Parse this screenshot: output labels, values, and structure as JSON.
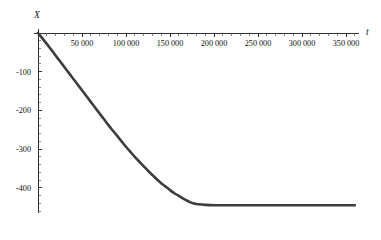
{
  "chart_data": {
    "type": "line",
    "title": "",
    "subtitle": "",
    "xlabel": "t",
    "ylabel": "X",
    "grid": false,
    "legend": null,
    "xlim": [
      0,
      365000
    ],
    "ylim": [
      -465,
      10
    ],
    "x_tick_labels": [
      "50 000",
      "100 000",
      "150 000",
      "200 000",
      "250 000",
      "300 000",
      "350 000"
    ],
    "x_tick_values": [
      50000,
      100000,
      150000,
      200000,
      250000,
      300000,
      350000
    ],
    "x_minor_tick_step": 10000,
    "y_tick_labels": [
      "-100",
      "-200",
      "-300",
      "-400"
    ],
    "y_tick_values": [
      -100,
      -200,
      -300,
      -400
    ],
    "y_minor_tick_step": 20,
    "series": [
      {
        "name": "X(t)",
        "color": "#3d3d3d",
        "line_width": 2.6,
        "x": [
          0,
          5000,
          10000,
          15000,
          20000,
          25000,
          30000,
          35000,
          40000,
          45000,
          50000,
          55000,
          60000,
          65000,
          70000,
          75000,
          80000,
          85000,
          90000,
          95000,
          100000,
          105000,
          110000,
          115000,
          120000,
          125000,
          130000,
          135000,
          140000,
          145000,
          150000,
          155000,
          160000,
          165000,
          170000,
          175000,
          180000,
          190000,
          200000,
          220000,
          240000,
          260000,
          280000,
          300000,
          320000,
          340000,
          360000
        ],
        "y": [
          0,
          -14,
          -28,
          -43,
          -58,
          -73,
          -88,
          -103,
          -118,
          -133,
          -148,
          -163,
          -178,
          -193,
          -208,
          -223,
          -238,
          -252,
          -266,
          -280,
          -294,
          -307,
          -320,
          -332,
          -344,
          -356,
          -367,
          -378,
          -388,
          -397,
          -406,
          -414,
          -421,
          -428,
          -434,
          -439,
          -442,
          -444,
          -445,
          -445,
          -445,
          -445,
          -445,
          -445,
          -445,
          -445,
          -445
        ]
      }
    ],
    "annotations": [],
    "plateau_value": -445,
    "plateau_onset_t": 175000
  },
  "axes": {
    "y_axis_label": "X",
    "x_axis_label": "t",
    "axis_color": "#1a1a1a"
  },
  "style": {
    "background": "#ffffff",
    "curve_color": "#3d3d3d",
    "tick_color": "#1a1a1a",
    "label_color": "#111111"
  }
}
